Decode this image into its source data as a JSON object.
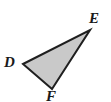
{
  "figure": {
    "type": "triangle-diagram",
    "background_color": "#ffffff",
    "shape": {
      "name": "triangle",
      "fill_color": "#c9c9c9",
      "stroke_color": "#1f1f1f",
      "stroke_width": 2,
      "vertices": [
        {
          "label": "D",
          "x": 23,
          "y": 64
        },
        {
          "label": "E",
          "x": 90,
          "y": 30
        },
        {
          "label": "F",
          "x": 52,
          "y": 89
        }
      ]
    },
    "labels": [
      {
        "id": "E",
        "text": "E",
        "x": 89,
        "y": 11
      },
      {
        "id": "D",
        "text": "D",
        "x": 4,
        "y": 55
      },
      {
        "id": "F",
        "text": "F",
        "x": 46,
        "y": 89
      }
    ]
  }
}
